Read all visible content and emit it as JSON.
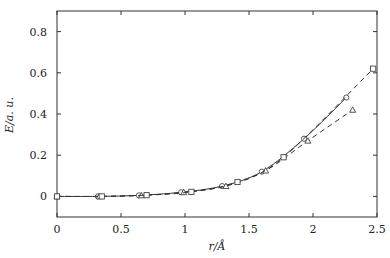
{
  "chart_data": {
    "type": "line",
    "title": "",
    "xlabel": "r/Å",
    "ylabel": "E/a. u.",
    "xlim": [
      0,
      2.5
    ],
    "ylim": [
      -0.1,
      0.9
    ],
    "x_ticks": [
      0,
      0.5,
      1,
      1.5,
      2,
      2.5
    ],
    "x_tick_labels": [
      "0",
      "0.5",
      "1",
      "1.5",
      "2",
      "2.5"
    ],
    "y_ticks": [
      0,
      0.2,
      0.4,
      0.6,
      0.8
    ],
    "y_tick_labels": [
      "0",
      "0.2",
      "0.4",
      "0.6",
      "0.8"
    ],
    "grid": false,
    "legend": null,
    "series": [
      {
        "name": "circles (solid)",
        "marker": "circle",
        "line": "solid",
        "x": [
          0,
          0.32,
          0.64,
          0.97,
          1.29,
          1.6,
          1.93,
          2.26
        ],
        "y": [
          0,
          0.0,
          0.005,
          0.02,
          0.05,
          0.12,
          0.28,
          0.48
        ]
      },
      {
        "name": "triangles (dashed)",
        "marker": "triangle",
        "line": "dashed",
        "x": [
          0,
          0.33,
          0.66,
          0.99,
          1.32,
          1.63,
          1.96,
          2.31
        ],
        "y": [
          0,
          0.0,
          0.005,
          0.02,
          0.05,
          0.125,
          0.27,
          0.42
        ]
      },
      {
        "name": "squares (dashed)",
        "marker": "square",
        "line": "dashed",
        "x": [
          0,
          0.35,
          0.7,
          1.05,
          1.41,
          1.77,
          2.47
        ],
        "y": [
          0,
          0.0,
          0.006,
          0.022,
          0.07,
          0.19,
          0.62
        ]
      }
    ]
  }
}
